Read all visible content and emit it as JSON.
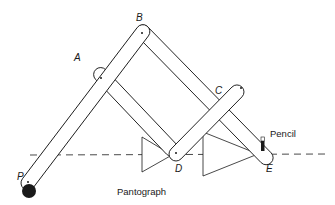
{
  "caption": "Pantograph",
  "labels": {
    "P": "P",
    "A": "A",
    "B": "B",
    "C": "C",
    "D": "D",
    "E": "E",
    "pencil": "Pencil"
  },
  "colors": {
    "stroke": "#1a1a1a",
    "fill": "#ffffff"
  }
}
